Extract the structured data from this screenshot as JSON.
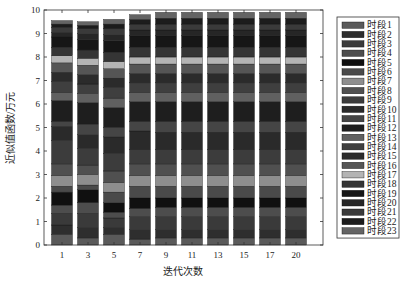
{
  "chart_data": {
    "type": "bar",
    "stacked": true,
    "title": "",
    "xlabel": "迭代次数",
    "ylabel": "近似值函数/万元",
    "ylim": [
      0,
      10
    ],
    "yticks": [
      0,
      1,
      2,
      3,
      4,
      5,
      6,
      7,
      8,
      9,
      10
    ],
    "categories": [
      "1",
      "3",
      "5",
      "7",
      "9",
      "11",
      "13",
      "15",
      "17",
      "20"
    ],
    "grid": false,
    "legend_position": "right",
    "series": [
      {
        "name": "时段1",
        "color": "#5a5a5a",
        "values": [
          0.45,
          0.3,
          0.45,
          0.25,
          0.3,
          0.3,
          0.3,
          0.3,
          0.3,
          0.3
        ]
      },
      {
        "name": "时段2",
        "color": "#2e2e2e",
        "values": [
          0.4,
          0.45,
          0.3,
          0.4,
          0.35,
          0.35,
          0.35,
          0.35,
          0.35,
          0.35
        ]
      },
      {
        "name": "时段3",
        "color": "#3a3a3a",
        "values": [
          0.5,
          0.6,
          0.4,
          0.55,
          0.55,
          0.55,
          0.55,
          0.55,
          0.55,
          0.55
        ]
      },
      {
        "name": "时段4",
        "color": "#4d4d4d",
        "values": [
          0.35,
          0.45,
          0.25,
          0.35,
          0.4,
          0.4,
          0.4,
          0.4,
          0.4,
          0.4
        ]
      },
      {
        "name": "时段5",
        "color": "#101010",
        "values": [
          0.55,
          0.55,
          0.4,
          0.45,
          0.4,
          0.4,
          0.4,
          0.4,
          0.4,
          0.4
        ]
      },
      {
        "name": "时段6",
        "color": "#4a4a4a",
        "values": [
          0.25,
          0.2,
          0.45,
          0.5,
          0.5,
          0.5,
          0.5,
          0.5,
          0.5,
          0.5
        ]
      },
      {
        "name": "时段7",
        "color": "#8e8e8e",
        "values": [
          0.45,
          0.45,
          0.4,
          0.45,
          0.45,
          0.45,
          0.45,
          0.45,
          0.45,
          0.45
        ]
      },
      {
        "name": "时段8",
        "color": "#505050",
        "values": [
          0.5,
          0.4,
          0.5,
          0.5,
          0.5,
          0.5,
          0.5,
          0.5,
          0.5,
          0.5
        ]
      },
      {
        "name": "时段9",
        "color": "#3c3c3c",
        "values": [
          1.0,
          0.7,
          0.75,
          0.6,
          0.6,
          0.6,
          0.6,
          0.6,
          0.6,
          0.6
        ]
      },
      {
        "name": "时段10",
        "color": "#2a2a2a",
        "values": [
          0.6,
          0.6,
          0.7,
          0.8,
          0.75,
          0.75,
          0.75,
          0.75,
          0.75,
          0.75
        ]
      },
      {
        "name": "时段11",
        "color": "#454545",
        "values": [
          0.2,
          0.45,
          0.4,
          0.4,
          0.45,
          0.45,
          0.45,
          0.45,
          0.45,
          0.45
        ]
      },
      {
        "name": "时段12",
        "color": "#1e1e1e",
        "values": [
          0.9,
          0.9,
          0.85,
          0.85,
          0.85,
          0.85,
          0.85,
          0.85,
          0.85,
          0.85
        ]
      },
      {
        "name": "时段13",
        "color": "#606060",
        "values": [
          0.35,
          0.4,
          0.4,
          0.4,
          0.4,
          0.4,
          0.4,
          0.4,
          0.4,
          0.4
        ]
      },
      {
        "name": "时段14",
        "color": "#3f3f3f",
        "values": [
          0.45,
          0.4,
          0.45,
          0.4,
          0.4,
          0.4,
          0.4,
          0.4,
          0.4,
          0.4
        ]
      },
      {
        "name": "时段15",
        "color": "#2b2b2b",
        "values": [
          0.4,
          0.4,
          0.4,
          0.4,
          0.4,
          0.4,
          0.4,
          0.4,
          0.4,
          0.4
        ]
      },
      {
        "name": "时段16",
        "color": "#555555",
        "values": [
          0.4,
          0.4,
          0.4,
          0.4,
          0.4,
          0.4,
          0.4,
          0.4,
          0.4,
          0.4
        ]
      },
      {
        "name": "时段17",
        "color": "#b4b4b4",
        "values": [
          0.3,
          0.3,
          0.3,
          0.3,
          0.3,
          0.3,
          0.3,
          0.3,
          0.3,
          0.3
        ]
      },
      {
        "name": "时段18",
        "color": "#353535",
        "values": [
          0.35,
          0.35,
          0.4,
          0.4,
          0.4,
          0.4,
          0.4,
          0.4,
          0.4,
          0.4
        ]
      },
      {
        "name": "时段19",
        "color": "#161616",
        "values": [
          0.45,
          0.45,
          0.5,
          0.5,
          0.5,
          0.5,
          0.5,
          0.5,
          0.5,
          0.5
        ]
      },
      {
        "name": "时段20",
        "color": "#262626",
        "values": [
          0.2,
          0.25,
          0.25,
          0.25,
          0.25,
          0.25,
          0.25,
          0.25,
          0.25,
          0.25
        ]
      },
      {
        "name": "时段21",
        "color": "#3a3a3a",
        "values": [
          0.2,
          0.2,
          0.25,
          0.25,
          0.25,
          0.25,
          0.25,
          0.25,
          0.25,
          0.25
        ]
      },
      {
        "name": "时段22",
        "color": "#1c1c1c",
        "values": [
          0.15,
          0.15,
          0.2,
          0.2,
          0.25,
          0.25,
          0.25,
          0.25,
          0.25,
          0.25
        ]
      },
      {
        "name": "时段23",
        "color": "#646464",
        "values": [
          0.15,
          0.15,
          0.2,
          0.2,
          0.25,
          0.25,
          0.25,
          0.25,
          0.25,
          0.25
        ]
      }
    ],
    "totals": [
      9.3,
      9.3,
      9.5,
      9.65,
      9.75,
      9.75,
      9.75,
      9.75,
      9.75,
      9.75
    ]
  }
}
